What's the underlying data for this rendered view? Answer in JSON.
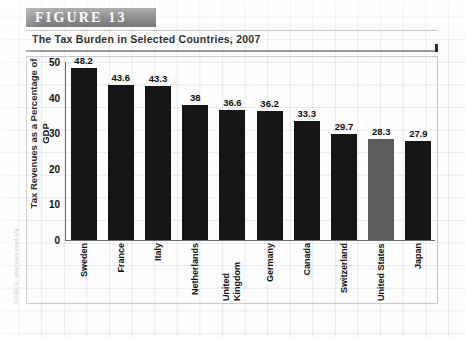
{
  "figure": {
    "band_label": "FIGURE  13",
    "title": "The Tax Burden in Selected Countries, 2007",
    "source": "SOURCE: www.stats.oecd.org"
  },
  "colors": {
    "band_background": "#58585a",
    "bar_default": "#151515",
    "bar_highlight": "#5c5c5e",
    "axis": "#6e6e70",
    "grid": "#c9c9cb"
  },
  "chart_data": {
    "type": "bar",
    "title": "The Tax Burden in Selected Countries, 2007",
    "xlabel": "",
    "ylabel": "Tax Revenues as a Percentage of GDP",
    "ylim": [
      0,
      50
    ],
    "yticks": [
      0,
      10,
      20,
      30,
      40,
      50
    ],
    "ytick_labels": [
      "0",
      "10",
      "20",
      "30",
      "40",
      "50"
    ],
    "grid": false,
    "legend": "none",
    "categories": [
      "Sweden",
      "France",
      "Italy",
      "Netherlands",
      "United Kingdom",
      "Germany",
      "Canada",
      "Switzerland",
      "United States",
      "Japan"
    ],
    "values": [
      48.2,
      43.6,
      43.3,
      38,
      36.6,
      36.2,
      33.3,
      29.7,
      28.3,
      27.9
    ],
    "value_labels": [
      "48.2",
      "43.6",
      "43.3",
      "38",
      "36.6",
      "36.2",
      "33.3",
      "29.7",
      "28.3",
      "27.9"
    ],
    "highlighted_category": "United States"
  }
}
